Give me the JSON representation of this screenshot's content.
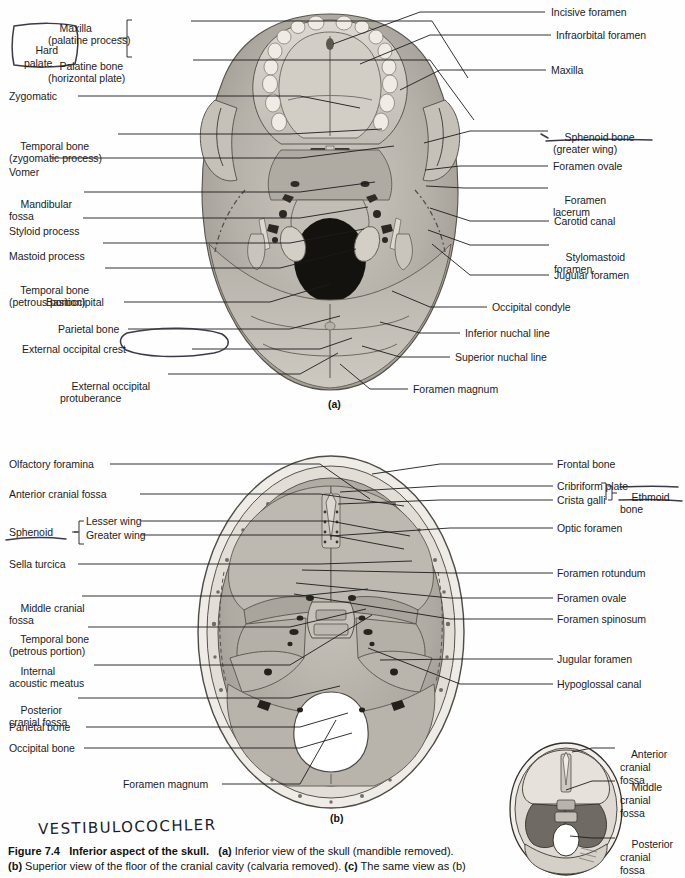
{
  "figure": {
    "number": "Figure 7.4",
    "title": "Inferior aspect of the skull.",
    "caption_a_marker": "(a)",
    "caption_a": "Inferior view of the skull (mandible removed).",
    "caption_b_marker": "(b)",
    "caption_b": "Superior view of the floor of the cranial cavity (calvaria removed).",
    "caption_c_marker": "(c)",
    "caption_c": "The same view as (b)"
  },
  "panel_markers": {
    "a": "(a)",
    "b": "(b)"
  },
  "annotation": {
    "handwritten_note": "VESTIBULOCOCHLER",
    "circled_terms": [
      "Hard palate",
      "External occipital crest"
    ],
    "underlined_terms": [
      "Sphenoid bone (greater wing)",
      "Ethmoid bone"
    ]
  },
  "panel_a": {
    "bracket_label": "Hard",
    "bracket_label2": "palate",
    "labels_left": [
      {
        "line1": "Maxilla",
        "line2": "(palatine process)"
      },
      {
        "line1": "Palatine bone",
        "line2": "(horizontal plate)"
      },
      {
        "line1": "Zygomatic",
        "line2": ""
      },
      {
        "line1": "Temporal bone",
        "line2": "(zygomatic process)"
      },
      {
        "line1": "Vomer",
        "line2": ""
      },
      {
        "line1": "Mandibular",
        "line2": "fossa"
      },
      {
        "line1": "Styloid process",
        "line2": ""
      },
      {
        "line1": "Mastoid process",
        "line2": ""
      },
      {
        "line1": "Temporal bone",
        "line2": "(petrous portion)"
      },
      {
        "line1": "Basioccipital",
        "line2": ""
      },
      {
        "line1": "Parietal bone",
        "line2": ""
      },
      {
        "line1": "External occipital crest",
        "line2": ""
      },
      {
        "line1": "External occipital",
        "line2": "protuberance"
      }
    ],
    "labels_right": [
      {
        "line1": "Incisive foramen",
        "line2": ""
      },
      {
        "line1": "Infraorbital foramen",
        "line2": ""
      },
      {
        "line1": "Maxilla",
        "line2": ""
      },
      {
        "line1": "Sphenoid bone",
        "line2": "(greater wing)"
      },
      {
        "line1": "Foramen ovale",
        "line2": ""
      },
      {
        "line1": "Foramen",
        "line2": "lacerum"
      },
      {
        "line1": "Carotid canal",
        "line2": ""
      },
      {
        "line1": "Stylomastoid",
        "line2": "foramen"
      },
      {
        "line1": "Jugular foramen",
        "line2": ""
      },
      {
        "line1": "Occipital condyle",
        "line2": ""
      },
      {
        "line1": "Inferior nuchal line",
        "line2": ""
      },
      {
        "line1": "Superior nuchal line",
        "line2": ""
      },
      {
        "line1": "Foramen magnum",
        "line2": ""
      }
    ]
  },
  "panel_b": {
    "sphenoid_label": "Sphenoid",
    "sphenoid_sub1": "Lesser wing",
    "sphenoid_sub2": "Greater wing",
    "ethmoid_label1": "Ethmoid",
    "ethmoid_label2": "bone",
    "labels_left": [
      {
        "line1": "Olfactory foramina",
        "line2": ""
      },
      {
        "line1": "Anterior cranial fossa",
        "line2": ""
      },
      {
        "line1": "Sella turcica",
        "line2": ""
      },
      {
        "line1": "Middle cranial",
        "line2": "fossa"
      },
      {
        "line1": "Temporal bone",
        "line2": "(petrous portion)"
      },
      {
        "line1": "Internal",
        "line2": "acoustic meatus"
      },
      {
        "line1": "Posterior",
        "line2": "cranial fossa"
      },
      {
        "line1": "Parietal bone",
        "line2": ""
      },
      {
        "line1": "Occipital bone",
        "line2": ""
      },
      {
        "line1": "Foramen magnum",
        "line2": ""
      }
    ],
    "labels_right": [
      {
        "line1": "Frontal bone",
        "line2": ""
      },
      {
        "line1": "Cribriform plate",
        "line2": ""
      },
      {
        "line1": "Crista galli",
        "line2": ""
      },
      {
        "line1": "Optic foramen",
        "line2": ""
      },
      {
        "line1": "Foramen rotundum",
        "line2": ""
      },
      {
        "line1": "Foramen ovale",
        "line2": ""
      },
      {
        "line1": "Foramen spinosum",
        "line2": ""
      },
      {
        "line1": "Jugular foramen",
        "line2": ""
      },
      {
        "line1": "Hypoglossal canal",
        "line2": ""
      }
    ]
  },
  "panel_c": {
    "labels_right": [
      {
        "line1": "Anterior",
        "line2": "cranial",
        "line3": "fossa"
      },
      {
        "line1": "Middle",
        "line2": "cranial",
        "line3": "fossa"
      },
      {
        "line1": "Posterior",
        "line2": "cranial",
        "line3": "fossa"
      }
    ]
  },
  "colors": {
    "ink": "#1c1c1c",
    "bone_light": "#d8d4cc",
    "bone_mid": "#b3aea5",
    "bone_dark": "#8d8880",
    "hand_ink": "#3a3a4a"
  }
}
